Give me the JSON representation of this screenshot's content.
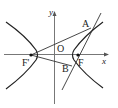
{
  "diagram": {
    "type": "hyperbola-with-foci",
    "labels": {
      "y_axis": "y",
      "x_axis": "x",
      "origin": "O",
      "focus_left": "F'",
      "focus_right": "F",
      "point_a": "A",
      "point_b": "B"
    },
    "colors": {
      "axis": "#777777",
      "curve": "#222222",
      "segment": "#333333",
      "background": "#ffffff"
    },
    "elements": [
      "x-axis with arrow",
      "y-axis with arrow",
      "left branch of hyperbola",
      "right branch of hyperbola",
      "focus F' (left)",
      "focus F (right)",
      "line through A, F, B",
      "segment F'A",
      "segment F'B"
    ]
  }
}
